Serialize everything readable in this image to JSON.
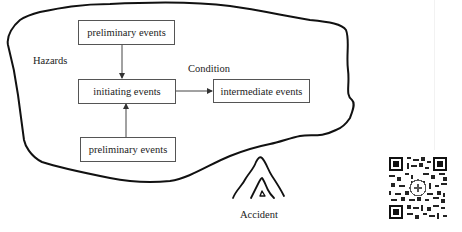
{
  "diagram": {
    "region_label": "Hazards",
    "condition_label": "Condition",
    "accident_label": "Accident",
    "nodes": [
      {
        "id": "preliminary_top",
        "label": "preliminary events"
      },
      {
        "id": "initiating",
        "label": "initiating events"
      },
      {
        "id": "intermediate",
        "label": "intermediate events"
      },
      {
        "id": "preliminary_bottom",
        "label": "preliminary events"
      }
    ],
    "edges": [
      {
        "from": "preliminary_top",
        "to": "initiating"
      },
      {
        "from": "preliminary_bottom",
        "to": "initiating"
      },
      {
        "from": "initiating",
        "to": "intermediate",
        "label": "Condition"
      }
    ],
    "colors": {
      "outline": "#111111",
      "box_border": "#555555",
      "text": "#222222"
    }
  },
  "decorations": {
    "accident_icon": "fire-flame-icon",
    "qr_code": "qr-code-icon"
  }
}
